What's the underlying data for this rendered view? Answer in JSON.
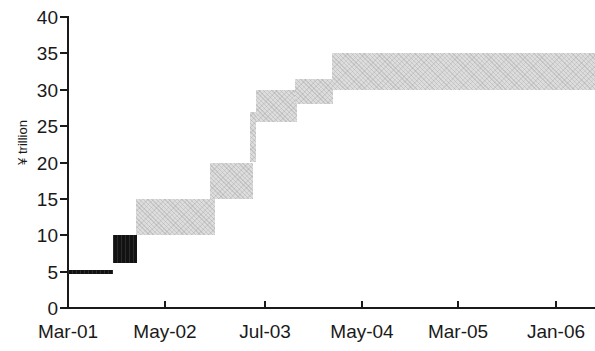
{
  "chart_data": {
    "type": "area",
    "title": "",
    "subtitle": "",
    "xlabel": "",
    "ylabel": "¥ trillion",
    "ylim": [
      0,
      40
    ],
    "yticks": [
      0,
      5,
      10,
      15,
      20,
      25,
      30,
      35,
      40
    ],
    "ytick_labels": [
      "0",
      "5",
      "10",
      "15",
      "20",
      "25",
      "30",
      "35",
      "40"
    ],
    "xtick_labels": [
      "Mar-01",
      "May-02",
      "Jul-03",
      "May-04",
      "Mar-05",
      "Jan-06"
    ],
    "grid": false,
    "legend": null,
    "annotations": [],
    "style_note": "stepped band / staircase range chart, no gridlines, plain black axes",
    "colors": {
      "band_light": "#dddddd",
      "band_dark": "#121212",
      "axis": "#1a1a1a",
      "background": "#ffffff"
    },
    "series": [
      {
        "name": "Outstanding balance range",
        "type": "step-band",
        "segments": [
          {
            "label": "Mar-01",
            "x_start": "Mar-01",
            "x_end": "Nov-01",
            "low": 5.0,
            "high": 5.0,
            "shade": "dark"
          },
          {
            "label": "Dec-01",
            "x_start": "Nov-01",
            "x_end": "Mar-02",
            "low": 6.2,
            "high": 10.0,
            "shade": "dark"
          },
          {
            "label": "Mar-02",
            "x_start": "Mar-02",
            "x_end": "Oct-02",
            "low": 10.0,
            "high": 15.0,
            "shade": "light"
          },
          {
            "label": "Oct-02",
            "x_start": "Oct-02",
            "x_end": "Apr-03",
            "low": 15.0,
            "high": 20.0,
            "shade": "light"
          },
          {
            "label": "Apr-03 riser",
            "x_start": "Apr-03",
            "x_end": "Apr-03",
            "low": 20.0,
            "high": 27.0,
            "shade": "light"
          },
          {
            "label": "Apr-03",
            "x_start": "Apr-03",
            "x_end": "Oct-03",
            "low": 25.5,
            "high": 30.0,
            "shade": "light"
          },
          {
            "label": "Oct-03",
            "x_start": "Oct-03",
            "x_end": "Jan-04",
            "low": 28.0,
            "high": 31.5,
            "shade": "light"
          },
          {
            "label": "Jan-04",
            "x_start": "Jan-04",
            "x_end": "Jan-06",
            "low": 30.0,
            "high": 35.0,
            "shade": "light"
          }
        ]
      }
    ],
    "geometry": {
      "plot_left_px": 68,
      "plot_right_px": 595,
      "plot_top_px": 17,
      "plot_bottom_px": 308,
      "y_min": 0,
      "y_max": 40,
      "xtick_px": [
        68,
        165,
        265,
        362,
        458,
        556
      ],
      "bands_px": [
        {
          "x": 68,
          "w": 45,
          "y_low": 4.7,
          "y_high": 5.2,
          "shade": "dark"
        },
        {
          "x": 113,
          "w": 24,
          "y_low": 6.2,
          "y_high": 10.0,
          "shade": "dark"
        },
        {
          "x": 136,
          "w": 79,
          "y_low": 10.0,
          "y_high": 15.0,
          "shade": "light"
        },
        {
          "x": 210,
          "w": 43,
          "y_low": 15.0,
          "y_high": 20.0,
          "shade": "light"
        },
        {
          "x": 250,
          "w": 6,
          "y_low": 20.0,
          "y_high": 27.0,
          "shade": "light"
        },
        {
          "x": 256,
          "w": 41,
          "y_low": 25.5,
          "y_high": 30.0,
          "shade": "light"
        },
        {
          "x": 295,
          "w": 38,
          "y_low": 28.0,
          "y_high": 31.5,
          "shade": "light"
        },
        {
          "x": 332,
          "w": 263,
          "y_low": 30.0,
          "y_high": 35.0,
          "shade": "light"
        }
      ]
    }
  }
}
